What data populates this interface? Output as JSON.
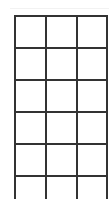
{
  "grid": {
    "columns": 3,
    "rows_visible": 6,
    "line_color": "#333333",
    "background": "#ffffff",
    "vertical_lines_x": [
      0,
      31,
      62,
      92
    ],
    "horizontal_lines_y": [
      0,
      32,
      64,
      96,
      128,
      160
    ]
  }
}
